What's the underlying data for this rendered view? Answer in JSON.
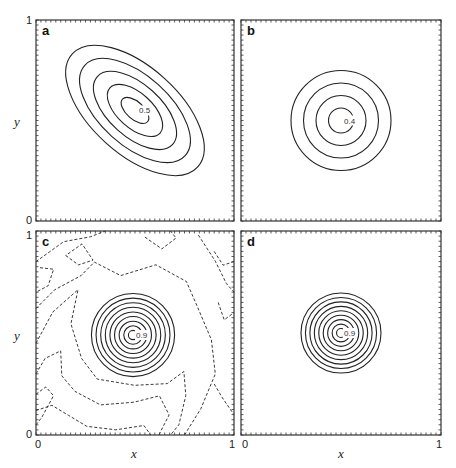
{
  "chart_data": {
    "type": "contour",
    "xlabel": "x",
    "ylabel": "y",
    "xlim": [
      0,
      1
    ],
    "ylim": [
      0,
      1
    ],
    "x_ticks": [
      "0",
      "1"
    ],
    "y_ticks": [
      "0",
      "1"
    ],
    "panels": [
      {
        "label": "a",
        "contour_type": "elliptical, tilted (negative correlation)",
        "center": [
          0.5,
          0.55
        ],
        "levels": 5,
        "peak_label": "0.5",
        "ellipse": {
          "rx_max": 0.22,
          "ry_max": 0.42,
          "angle_deg": -48
        },
        "dashed_contours": false
      },
      {
        "label": "b",
        "contour_type": "circular",
        "center": [
          0.5,
          0.5
        ],
        "levels": 4,
        "peak_label": "0.4",
        "radius_max": 0.25,
        "dashed_contours": false
      },
      {
        "label": "c",
        "contour_type": "circular with noisy dashed negative contours",
        "center": [
          0.49,
          0.49
        ],
        "levels": 9,
        "peak_label": "0.9",
        "radius_max": 0.21,
        "dashed_contours": true
      },
      {
        "label": "d",
        "contour_type": "circular",
        "center": [
          0.5,
          0.5
        ],
        "levels": 9,
        "peak_label": "0.9",
        "radius_max": 0.2,
        "dashed_contours": false
      }
    ]
  },
  "layout": {
    "panels_px": [
      {
        "x": 36,
        "y": 20,
        "w": 198,
        "h": 201
      },
      {
        "x": 241,
        "y": 20,
        "w": 200,
        "h": 201
      },
      {
        "x": 36,
        "y": 231,
        "w": 198,
        "h": 204
      },
      {
        "x": 241,
        "y": 231,
        "w": 200,
        "h": 204
      }
    ],
    "line_color": "#222222",
    "frame_color": "#333333"
  }
}
